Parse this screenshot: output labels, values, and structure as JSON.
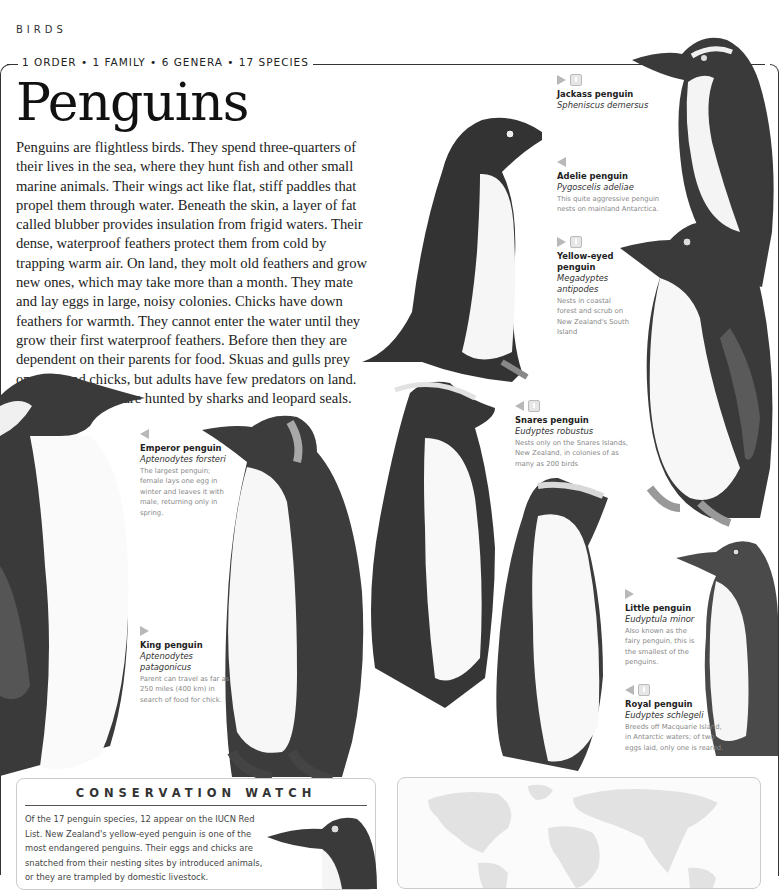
{
  "header": {
    "section": "BIRDS",
    "classification": "1 ORDER • 1 FAMILY • 6 GENERA • 17 SPECIES",
    "title": "Penguins"
  },
  "intro": "Penguins are flightless birds. They spend three-quarters of their lives in the sea, where they hunt fish and other small marine animals. Their wings act like flat, stiff paddles that propel them through water. Beneath the skin, a layer of fat called blubber provides insulation from frigid waters. Their dense, waterproof feathers protect them from cold by trapping warm air. On land, they molt old feathers and grow new ones, which may take more than a month. They mate and lay eggs in large, noisy colonies. Chicks have down feathers for warmth. They cannot enter the water until they grow their first waterproof feathers. Before then they are dependent on their parents for food. Skuas and gulls prey on eggs and chicks, but adults have few predators on land. In the ocean, they are hunted by sharks and leopard seals.",
  "species": [
    {
      "common": "Jackass penguin",
      "latin": "Spheniscus demersus",
      "desc": "",
      "arrow": "right",
      "status_icon": true
    },
    {
      "common": "Adelie penguin",
      "latin": "Pygoscelis adeliae",
      "desc": "This quite aggressive penguin nests on mainland Antarctica.",
      "arrow": "left",
      "status_icon": false
    },
    {
      "common": "Yellow-eyed penguin",
      "latin": "Megadyptes antipodes",
      "desc": "Nests in coastal forest and scrub on New Zealand's South Island",
      "arrow": "right",
      "status_icon": true
    },
    {
      "common": "Snares penguin",
      "latin": "Eudyptes robustus",
      "desc": "Nests only on the Snares Islands, New Zealand, in colonies of as many as 200 birds",
      "arrow": "left",
      "status_icon": true
    },
    {
      "common": "Emperor penguin",
      "latin": "Aptenodytes forsteri",
      "desc": "The largest penguin; female lays one egg in winter and leaves it with male, returning only in spring.",
      "arrow": "left",
      "status_icon": false
    },
    {
      "common": "King penguin",
      "latin": "Aptenodytes patagonicus",
      "desc": "Parent can travel as far as 250 miles (400 km) in search of food for chick.",
      "arrow": "right",
      "status_icon": false
    },
    {
      "common": "Little penguin",
      "latin": "Eudyptula minor",
      "desc": "Also known as the fairy penguin, this is the smallest of the penguins.",
      "arrow": "right",
      "status_icon": false
    },
    {
      "common": "Royal penguin",
      "latin": "Eudyptes schlegeli",
      "desc": "Breeds off Macquarie Island, in Antarctic waters; of two eggs laid, only one is reared.",
      "arrow": "left",
      "status_icon": true
    }
  ],
  "conservation": {
    "heading": "CONSERVATION WATCH",
    "text": "Of the 17 penguin species, 12 appear on the IUCN Red List. New Zealand's yellow-eyed penguin is one of the most endangered penguins. Their eggs and chicks are snatched from their nesting sites by introduced animals, or they are trampled by domestic livestock."
  },
  "colors": {
    "text": "#222222",
    "caption_grey": "#888888",
    "marker_grey": "#b8b8b8",
    "frame": "#333333"
  }
}
